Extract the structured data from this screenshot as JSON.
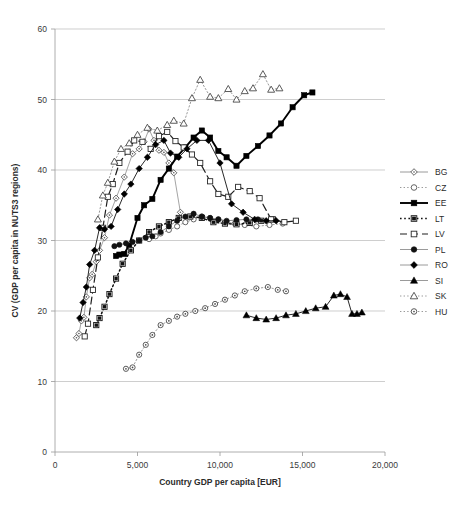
{
  "chart_data": {
    "type": "line",
    "title": "",
    "xlabel": "Country GDP per capita [EUR]",
    "ylabel": "CV (GDP per capita in NUTS3 regions)",
    "xlim": [
      0,
      20000
    ],
    "ylim": [
      0,
      60
    ],
    "xticks": [
      0,
      5000,
      10000,
      15000,
      20000
    ],
    "xticklabels": [
      "0",
      "5,000",
      "10,000",
      "15,000",
      "20,000"
    ],
    "yticks": [
      0,
      10,
      20,
      30,
      40,
      50,
      60
    ],
    "yticklabels": [
      "0",
      "10",
      "20",
      "30",
      "40",
      "50",
      "60"
    ],
    "grid": "horizontal",
    "legend_position": "right",
    "series": [
      {
        "name": "BG",
        "marker": "diamond-open",
        "line": "solid-light",
        "color": "#9a9a9a",
        "points": [
          [
            1300,
            16.2
          ],
          [
            1450,
            16.8
          ],
          [
            1600,
            18.6
          ],
          [
            1750,
            19.1
          ],
          [
            1900,
            22.0
          ],
          [
            2100,
            24.7
          ],
          [
            2250,
            25.2
          ],
          [
            2500,
            27.0
          ],
          [
            2700,
            28.6
          ],
          [
            3000,
            30.4
          ],
          [
            3300,
            33.6
          ],
          [
            3700,
            36.0
          ],
          [
            4200,
            39.0
          ],
          [
            4700,
            42.3
          ],
          [
            5100,
            43.0
          ],
          [
            5400,
            44.0
          ],
          [
            5700,
            45.8
          ],
          [
            6000,
            44.2
          ],
          [
            6300,
            42.8
          ],
          [
            6600,
            42.5
          ],
          [
            6900,
            41.0
          ],
          [
            7200,
            39.6
          ],
          [
            7600,
            34.0
          ]
        ]
      },
      {
        "name": "CZ",
        "marker": "circle-open",
        "line": "dotted",
        "color": "#8f8f8f",
        "points": [
          [
            5700,
            30.2
          ],
          [
            6100,
            30.6
          ],
          [
            6400,
            31.0
          ],
          [
            6900,
            31.5
          ],
          [
            7400,
            32.0
          ],
          [
            7900,
            32.6
          ],
          [
            8400,
            33.0
          ],
          [
            8900,
            33.4
          ],
          [
            9400,
            33.2
          ],
          [
            9900,
            33.0
          ],
          [
            10400,
            32.6
          ],
          [
            10900,
            32.4
          ],
          [
            11500,
            32.2
          ],
          [
            12200,
            32.0
          ],
          [
            13000,
            32.2
          ],
          [
            13800,
            32.4
          ]
        ]
      },
      {
        "name": "EE",
        "marker": "square-filled",
        "line": "solid-heavy",
        "color": "#111111",
        "points": [
          [
            3700,
            27.8
          ],
          [
            3900,
            28.0
          ],
          [
            4200,
            28.1
          ],
          [
            4500,
            29.4
          ],
          [
            5000,
            33.2
          ],
          [
            5400,
            35.0
          ],
          [
            5900,
            35.9
          ],
          [
            6400,
            38.6
          ],
          [
            6900,
            40.2
          ],
          [
            7400,
            41.9
          ],
          [
            7900,
            43.2
          ],
          [
            8400,
            44.6
          ],
          [
            8900,
            45.6
          ],
          [
            9400,
            44.6
          ],
          [
            9900,
            42.7
          ],
          [
            10400,
            41.8
          ],
          [
            11000,
            40.6
          ],
          [
            11600,
            42.0
          ],
          [
            12300,
            43.4
          ],
          [
            13000,
            44.9
          ],
          [
            13700,
            46.6
          ],
          [
            14400,
            48.9
          ],
          [
            15100,
            50.6
          ],
          [
            15600,
            51.0
          ]
        ]
      },
      {
        "name": "LT",
        "marker": "square-half",
        "line": "dotted-heavy",
        "color": "#1a1a1a",
        "points": [
          [
            2500,
            18.0
          ],
          [
            2700,
            19.0
          ],
          [
            3000,
            20.6
          ],
          [
            3300,
            22.4
          ],
          [
            3700,
            24.6
          ],
          [
            4100,
            26.7
          ],
          [
            4600,
            28.6
          ],
          [
            5100,
            30.0
          ],
          [
            5700,
            31.2
          ],
          [
            6300,
            32.0
          ],
          [
            6900,
            32.6
          ],
          [
            7500,
            33.2
          ],
          [
            8200,
            33.4
          ],
          [
            8900,
            33.2
          ],
          [
            9600,
            32.6
          ],
          [
            10300,
            32.4
          ],
          [
            11000,
            32.3
          ],
          [
            11800,
            32.5
          ],
          [
            12500,
            32.8
          ],
          [
            13200,
            33.0
          ]
        ]
      },
      {
        "name": "LV",
        "marker": "square-open",
        "line": "dashed",
        "color": "#333333",
        "points": [
          [
            1800,
            16.4
          ],
          [
            2000,
            18.2
          ],
          [
            2300,
            23.0
          ],
          [
            2600,
            27.6
          ],
          [
            2900,
            31.8
          ],
          [
            3200,
            36.2
          ],
          [
            3500,
            38.0
          ],
          [
            3900,
            41.0
          ],
          [
            4400,
            42.6
          ],
          [
            4800,
            44.2
          ],
          [
            5300,
            44.0
          ],
          [
            5800,
            43.0
          ],
          [
            6300,
            44.8
          ],
          [
            6800,
            45.4
          ],
          [
            7300,
            44.1
          ],
          [
            7800,
            43.2
          ],
          [
            8300,
            42.2
          ],
          [
            8800,
            41.0
          ],
          [
            9400,
            38.4
          ],
          [
            9900,
            36.6
          ],
          [
            10500,
            36.2
          ],
          [
            11100,
            37.6
          ],
          [
            11800,
            37.0
          ],
          [
            12400,
            36.0
          ],
          [
            13100,
            33.0
          ],
          [
            13900,
            32.6
          ],
          [
            14600,
            32.8
          ]
        ]
      },
      {
        "name": "PL",
        "marker": "circle-filled",
        "line": "solid-light",
        "color": "#7d7d7d",
        "points": [
          [
            3600,
            29.2
          ],
          [
            3900,
            29.4
          ],
          [
            4300,
            29.6
          ],
          [
            4700,
            29.8
          ],
          [
            5100,
            30.0
          ],
          [
            5500,
            30.4
          ],
          [
            5900,
            30.6
          ],
          [
            6400,
            31.2
          ],
          [
            6900,
            32.0
          ],
          [
            7400,
            32.8
          ],
          [
            7900,
            33.4
          ],
          [
            8400,
            33.8
          ],
          [
            8900,
            33.4
          ],
          [
            9400,
            33.2
          ],
          [
            9900,
            33.0
          ],
          [
            10400,
            32.8
          ],
          [
            11000,
            32.9
          ],
          [
            11600,
            33.0
          ],
          [
            12300,
            33.0
          ]
        ]
      },
      {
        "name": "RO",
        "marker": "diamond-filled",
        "line": "solid-light",
        "color": "#111111",
        "points": [
          [
            1500,
            19.0
          ],
          [
            1700,
            21.2
          ],
          [
            1900,
            23.4
          ],
          [
            2100,
            26.6
          ],
          [
            2400,
            28.6
          ],
          [
            2700,
            31.8
          ],
          [
            3000,
            31.6
          ],
          [
            3400,
            32.0
          ],
          [
            3800,
            34.4
          ],
          [
            4200,
            36.6
          ],
          [
            4600,
            38.0
          ],
          [
            5100,
            40.2
          ],
          [
            5600,
            41.8
          ],
          [
            6100,
            43.6
          ],
          [
            6600,
            44.2
          ],
          [
            7000,
            42.4
          ],
          [
            7500,
            41.8
          ],
          [
            8000,
            43.0
          ],
          [
            8600,
            44.2
          ],
          [
            9300,
            44.2
          ],
          [
            10000,
            41.0
          ],
          [
            10700,
            35.2
          ],
          [
            11400,
            34.0
          ],
          [
            12100,
            33.0
          ],
          [
            12800,
            32.8
          ],
          [
            13400,
            32.8
          ]
        ]
      },
      {
        "name": "SI",
        "marker": "triangle-filled",
        "line": "solid-light",
        "color": "#111111",
        "points": [
          [
            11600,
            19.4
          ],
          [
            12200,
            19.0
          ],
          [
            12800,
            18.8
          ],
          [
            13400,
            19.0
          ],
          [
            14000,
            19.4
          ],
          [
            14600,
            19.6
          ],
          [
            15200,
            20.0
          ],
          [
            15800,
            20.4
          ],
          [
            16400,
            20.6
          ],
          [
            16900,
            22.2
          ],
          [
            17300,
            22.4
          ],
          [
            17700,
            22.0
          ],
          [
            18000,
            19.6
          ],
          [
            18300,
            19.6
          ],
          [
            18600,
            19.8
          ]
        ]
      },
      {
        "name": "SK",
        "marker": "triangle-open",
        "line": "dotted",
        "color": "#8f8f8f",
        "points": [
          [
            2600,
            33.0
          ],
          [
            2900,
            36.4
          ],
          [
            3200,
            38.2
          ],
          [
            3600,
            41.2
          ],
          [
            4000,
            43.0
          ],
          [
            4500,
            43.8
          ],
          [
            5000,
            45.0
          ],
          [
            5600,
            46.0
          ],
          [
            6200,
            45.6
          ],
          [
            6800,
            46.4
          ],
          [
            7200,
            47.0
          ],
          [
            7800,
            46.6
          ],
          [
            8300,
            50.2
          ],
          [
            8800,
            52.8
          ],
          [
            9400,
            50.4
          ],
          [
            9900,
            50.2
          ],
          [
            10500,
            51.5
          ],
          [
            11000,
            50.0
          ],
          [
            11500,
            51.2
          ],
          [
            12000,
            51.6
          ],
          [
            12600,
            53.6
          ],
          [
            13100,
            51.4
          ],
          [
            13600,
            51.6
          ]
        ]
      },
      {
        "name": "HU",
        "marker": "circle-dot",
        "line": "dotted",
        "color": "#8f8f8f",
        "points": [
          [
            4300,
            11.8
          ],
          [
            4700,
            12.0
          ],
          [
            5100,
            13.8
          ],
          [
            5500,
            15.2
          ],
          [
            5900,
            16.6
          ],
          [
            6400,
            18.0
          ],
          [
            6900,
            18.6
          ],
          [
            7400,
            19.2
          ],
          [
            7900,
            19.6
          ],
          [
            8500,
            20.0
          ],
          [
            9100,
            20.4
          ],
          [
            9700,
            21.0
          ],
          [
            10300,
            21.6
          ],
          [
            10900,
            22.2
          ],
          [
            11500,
            22.8
          ],
          [
            12200,
            23.2
          ],
          [
            12900,
            23.4
          ],
          [
            13500,
            23.0
          ],
          [
            14000,
            22.8
          ]
        ]
      }
    ]
  },
  "legend": {
    "items": [
      {
        "label": "BG",
        "marker": "diamond-open",
        "line": "solid-light"
      },
      {
        "label": "CZ",
        "marker": "circle-open",
        "line": "dotted"
      },
      {
        "label": "EE",
        "marker": "square-filled",
        "line": "solid-heavy"
      },
      {
        "label": "LT",
        "marker": "square-half",
        "line": "dotted-heavy"
      },
      {
        "label": "LV",
        "marker": "square-open",
        "line": "dashed"
      },
      {
        "label": "PL",
        "marker": "circle-filled",
        "line": "solid-light"
      },
      {
        "label": "RO",
        "marker": "diamond-filled",
        "line": "solid-light"
      },
      {
        "label": "SI",
        "marker": "triangle-filled",
        "line": "solid-light"
      },
      {
        "label": "SK",
        "marker": "triangle-open",
        "line": "dotted"
      },
      {
        "label": "HU",
        "marker": "circle-dot",
        "line": "dotted"
      }
    ]
  }
}
